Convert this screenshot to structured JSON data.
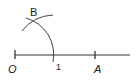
{
  "diagram": {
    "type": "geometric-construction",
    "labels": {
      "origin": "O",
      "unit": "1",
      "point_a": "A",
      "point_b": "B"
    },
    "elements": [
      "number line from O through A",
      "arc centered at O through unit mark 1",
      "intersecting arc locating B"
    ],
    "stroke_color": "#333333"
  }
}
